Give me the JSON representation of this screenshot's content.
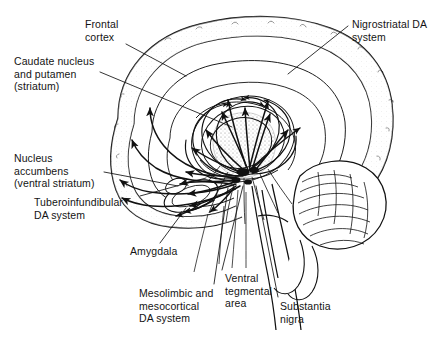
{
  "figure": {
    "type": "anatomical-diagram",
    "style": "black-and-white line drawing with stipple shading",
    "colors": {
      "background": "#ffffff",
      "ink": "#111111",
      "stipple": "#9a9a9a",
      "shade": "#e9e9e9"
    }
  },
  "labels": [
    {
      "id": "frontal-cortex",
      "text": "Frontal\ncortex",
      "x": 85,
      "y": 18
    },
    {
      "id": "caudate-putamen",
      "text": "Caudate nucleus\nand putamen\n(striatum)",
      "x": 14,
      "y": 55
    },
    {
      "id": "nucleus-accumbens",
      "text": "Nucleus\naccumbens\n(ventral striatum)",
      "x": 14,
      "y": 152
    },
    {
      "id": "tuberoinfundibular",
      "text": "Tuberoinfundibular\nDA system",
      "x": 34,
      "y": 196
    },
    {
      "id": "amygdala",
      "text": "Amygdala",
      "x": 130,
      "y": 245
    },
    {
      "id": "mesolimbic",
      "text": "Mesolimbic and\nmesocortical\nDA system",
      "x": 139,
      "y": 287
    },
    {
      "id": "ventral-tegmental",
      "text": "Ventral\ntegmental\narea",
      "x": 225,
      "y": 272
    },
    {
      "id": "substantia-nigra",
      "text": "Substantia\nnigra",
      "x": 280,
      "y": 300
    },
    {
      "id": "nigrostriatal",
      "text": "Nigrostriatal DA\nsystem",
      "x": 352,
      "y": 18
    }
  ],
  "structures": [
    {
      "id": "cerebral-cortex",
      "name": "Cerebral cortex outline"
    },
    {
      "id": "frontal-cortex",
      "name": "Frontal cortex"
    },
    {
      "id": "striatum",
      "name": "Caudate nucleus and putamen (striatum)"
    },
    {
      "id": "nucleus-accumbens",
      "name": "Nucleus accumbens (ventral striatum)"
    },
    {
      "id": "thalamus",
      "name": "Thalamus / diencephalon (stippled)"
    },
    {
      "id": "amygdala",
      "name": "Amygdala"
    },
    {
      "id": "ventral-tegmental-area",
      "name": "Ventral tegmental area"
    },
    {
      "id": "substantia-nigra",
      "name": "Substantia nigra"
    },
    {
      "id": "cerebellum",
      "name": "Cerebellum"
    },
    {
      "id": "brainstem",
      "name": "Brainstem"
    }
  ],
  "pathways": [
    {
      "id": "nigrostriatal-da-system",
      "name": "Nigrostriatal DA system"
    },
    {
      "id": "mesolimbic-mesocortical",
      "name": "Mesolimbic and mesocortical DA system"
    },
    {
      "id": "tuberoinfundibular",
      "name": "Tuberoinfundibular DA system"
    }
  ]
}
